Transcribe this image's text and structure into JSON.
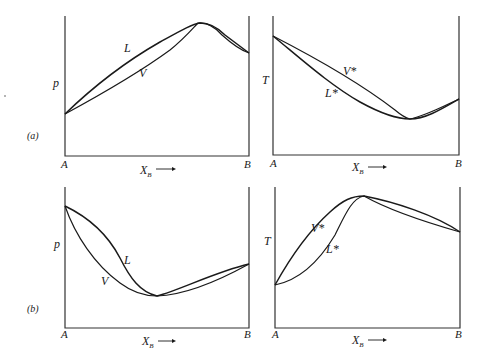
{
  "figure": {
    "rows": [
      {
        "row_label": "(a)",
        "panels": [
          {
            "id": "a-pressure",
            "y_label": "p",
            "x_label": "X",
            "x_label_sub": "B",
            "x_left": "A",
            "x_right": "B",
            "curve_upper_label": "L",
            "curve_lower_label": "V",
            "extremum": "maximum"
          },
          {
            "id": "a-temperature",
            "y_label": "T",
            "x_label": "X",
            "x_label_sub": "B",
            "x_left": "A",
            "x_right": "B",
            "curve_upper_label": "V*",
            "curve_lower_label": "L*",
            "extremum": "minimum"
          }
        ]
      },
      {
        "row_label": "(b)",
        "panels": [
          {
            "id": "b-pressure",
            "y_label": "p",
            "x_label": "X",
            "x_label_sub": "B",
            "x_left": "A",
            "x_right": "B",
            "curve_upper_label": "L",
            "curve_lower_label": "V",
            "extremum": "minimum"
          },
          {
            "id": "b-temperature",
            "y_label": "T",
            "x_label": "X",
            "x_label_sub": "B",
            "x_left": "A",
            "x_right": "B",
            "curve_upper_label": "V*",
            "curve_lower_label": "L*",
            "extremum": "maximum"
          }
        ]
      }
    ],
    "arrow_glyph": "→"
  }
}
